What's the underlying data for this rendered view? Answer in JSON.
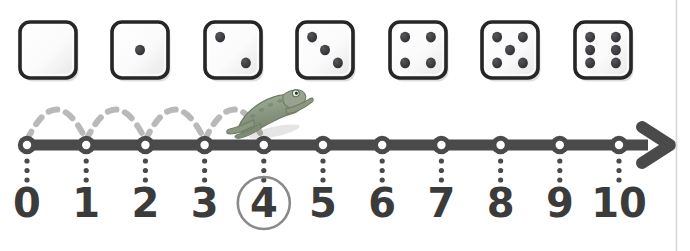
{
  "figure": {
    "background_color": "#ffffff"
  },
  "dice_row": {
    "name": "dice-strip",
    "count": 7,
    "face_fill": "#fbfbfb",
    "face_border": "#262626",
    "pip_color": "#3a3a3a",
    "dice": [
      {
        "label": "blank",
        "value": 0,
        "pips": 0
      },
      {
        "label": "one",
        "value": 1,
        "pips": 1
      },
      {
        "label": "two",
        "value": 2,
        "pips": 2
      },
      {
        "label": "three",
        "value": 3,
        "pips": 3
      },
      {
        "label": "four",
        "value": 4,
        "pips": 4
      },
      {
        "label": "five",
        "value": 5,
        "pips": 5
      },
      {
        "label": "six",
        "value": 6,
        "pips": 6
      }
    ]
  },
  "number_line": {
    "name": "number-line",
    "line_color": "#4a4a4a",
    "tick_fill": "#ffffff",
    "label_color": "#3b3b3b",
    "start": 0,
    "end": 10,
    "arrow": "right-arrow",
    "ticks": [
      {
        "value": 0,
        "label": "0"
      },
      {
        "value": 1,
        "label": "1"
      },
      {
        "value": 2,
        "label": "2"
      },
      {
        "value": 3,
        "label": "3"
      },
      {
        "value": 4,
        "label": "4"
      },
      {
        "value": 5,
        "label": "5"
      },
      {
        "value": 6,
        "label": "6"
      },
      {
        "value": 7,
        "label": "7"
      },
      {
        "value": 8,
        "label": "8"
      },
      {
        "value": 9,
        "label": "9"
      },
      {
        "value": 10,
        "label": "10"
      }
    ],
    "highlighted_label": {
      "value": 4,
      "label": "4",
      "marker": "circle",
      "color": "#8a8a8a"
    }
  },
  "jumps": {
    "name": "frog-jump-arcs",
    "style": "dashed",
    "color": "#b9b9b9",
    "count": 4,
    "arcs": [
      {
        "from": 0,
        "to": 1
      },
      {
        "from": 1,
        "to": 2
      },
      {
        "from": 2,
        "to": 3
      },
      {
        "from": 3,
        "to": 4
      }
    ]
  },
  "frog": {
    "name": "frog-figure",
    "position_value": 4,
    "direction": "right",
    "body_color": "#8f9c86",
    "shade_color": "#6f7c68"
  }
}
